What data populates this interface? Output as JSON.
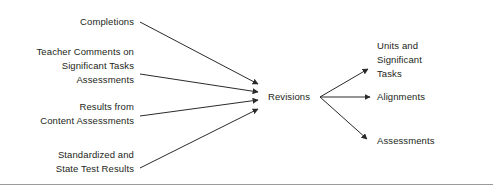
{
  "diagram": {
    "type": "converge-diverge-flow",
    "hub": {
      "label": "Revisions"
    },
    "inputs": [
      {
        "id": "completions",
        "label": "Completions"
      },
      {
        "id": "teacher",
        "label": "Teacher Comments on\nSignificant Tasks\nAssessments"
      },
      {
        "id": "results",
        "label": "Results from\nContent Assessments"
      },
      {
        "id": "standardized",
        "label": "Standardized and\nState Test Results"
      }
    ],
    "outputs": [
      {
        "id": "units",
        "label": "Units and\nSignificant\nTasks"
      },
      {
        "id": "alignments",
        "label": "Alignments"
      },
      {
        "id": "assessments",
        "label": "Assessments"
      }
    ],
    "colors": {
      "background": "#ffffff",
      "text": "#231f20",
      "stroke": "#2a2a2a",
      "rule": "#9a9a9a"
    },
    "connectors": {
      "incoming": [
        {
          "from": "completions",
          "x1": 140,
          "y1": 22,
          "x2": 258,
          "y2": 84
        },
        {
          "from": "teacher",
          "x1": 140,
          "y1": 74,
          "x2": 258,
          "y2": 92
        },
        {
          "from": "results",
          "x1": 140,
          "y1": 116,
          "x2": 258,
          "y2": 100
        },
        {
          "from": "standardized",
          "x1": 140,
          "y1": 168,
          "x2": 258,
          "y2": 109
        }
      ],
      "outgoing": [
        {
          "to": "units",
          "x1": 320,
          "y1": 97,
          "x2": 368,
          "y2": 69
        },
        {
          "to": "alignments",
          "x1": 320,
          "y1": 97,
          "x2": 370,
          "y2": 97
        },
        {
          "to": "assessments",
          "x1": 320,
          "y1": 97,
          "x2": 367,
          "y2": 139
        }
      ]
    },
    "footer_rule": {
      "y": 184,
      "x1": 0,
      "x2": 493
    }
  }
}
